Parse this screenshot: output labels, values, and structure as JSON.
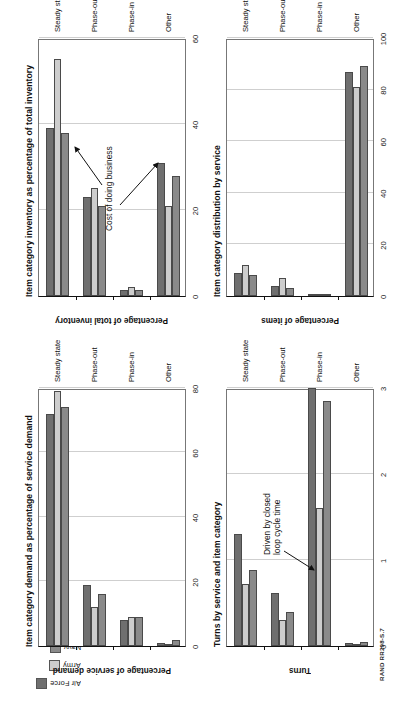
{
  "figure": {
    "source_note": "RAND RR298-S.7",
    "legend": {
      "title": "legend",
      "items": [
        {
          "label": "Air Force",
          "color": "#6f6f6f"
        },
        {
          "label": "Army",
          "color": "#cdcdcd"
        },
        {
          "label": "Navy",
          "color": "#8a8a8a"
        }
      ]
    }
  },
  "chart_data": [
    {
      "id": "turns",
      "type": "bar",
      "title": "Turns by service and item category",
      "xlabel": "",
      "ylabel": "Turns",
      "ylim": [
        0,
        3
      ],
      "yticks": [
        0,
        1,
        2,
        3
      ],
      "ytick_labels": [
        "0",
        "1",
        "2",
        "3"
      ],
      "grid": true,
      "orientation": "horizontal",
      "legend_position": "top-left",
      "categories": [
        "Steady state",
        "Phase-out",
        "Phase-in",
        "Other"
      ],
      "series": [
        {
          "name": "Air Force",
          "color": "#6f6f6f",
          "values": [
            1.3,
            0.62,
            3.0,
            0.03
          ]
        },
        {
          "name": "Army",
          "color": "#cdcdcd",
          "values": [
            0.72,
            0.3,
            1.6,
            0.02
          ]
        },
        {
          "name": "Navy",
          "color": "#8a8a8a",
          "values": [
            0.88,
            0.4,
            2.85,
            0.05
          ]
        }
      ],
      "annotations": [
        {
          "text": "Driven by closed\nloop cycle time",
          "target": "Phase-in"
        }
      ]
    },
    {
      "id": "demand",
      "type": "bar",
      "title": "Item category demand as percentage of service demand",
      "xlabel": "",
      "ylabel": "Percentage of service demand",
      "ylim": [
        0,
        80
      ],
      "yticks": [
        0,
        20,
        40,
        60,
        80
      ],
      "ytick_labels": [
        "0",
        "20",
        "40",
        "60",
        "80"
      ],
      "grid": true,
      "orientation": "horizontal",
      "legend_position": "top-left",
      "categories": [
        "Steady state",
        "Phase-out",
        "Phase-in",
        "Other"
      ],
      "series": [
        {
          "name": "Air Force",
          "color": "#6f6f6f",
          "values": [
            72,
            19,
            8,
            1
          ]
        },
        {
          "name": "Army",
          "color": "#cdcdcd",
          "values": [
            79,
            12,
            9,
            0.5
          ]
        },
        {
          "name": "Navy",
          "color": "#8a8a8a",
          "values": [
            74,
            16,
            9,
            2
          ]
        }
      ],
      "annotations": []
    },
    {
      "id": "inventory",
      "type": "bar",
      "title": "Item category inventory as percentage of total inventory",
      "xlabel": "",
      "ylabel": "Percentage of total inventory",
      "ylim": [
        0,
        60
      ],
      "yticks": [
        0,
        20,
        40,
        60
      ],
      "ytick_labels": [
        "0",
        "20",
        "40",
        "60"
      ],
      "grid": true,
      "orientation": "horizontal",
      "legend_position": "top-left",
      "categories": [
        "Steady state",
        "Phase-out",
        "Phase-in",
        "Other"
      ],
      "series": [
        {
          "name": "Air Force",
          "color": "#6f6f6f",
          "values": [
            39,
            23,
            1.5,
            31
          ]
        },
        {
          "name": "Army",
          "color": "#cdcdcd",
          "values": [
            55,
            25,
            2,
            21
          ]
        },
        {
          "name": "Navy",
          "color": "#8a8a8a",
          "values": [
            38,
            21,
            1.5,
            28
          ]
        }
      ],
      "annotations": [
        {
          "text": "Cost of doing business",
          "target": "Phase-out and Other"
        }
      ]
    },
    {
      "id": "distribution",
      "type": "bar",
      "title": "Item category distribution by service",
      "xlabel": "",
      "ylabel": "Percentage of items",
      "ylim": [
        0,
        100
      ],
      "yticks": [
        0,
        20,
        40,
        60,
        80,
        100
      ],
      "ytick_labels": [
        "0",
        "20",
        "40",
        "60",
        "80",
        "100"
      ],
      "grid": true,
      "orientation": "horizontal",
      "legend_position": "top-left",
      "categories": [
        "Steady state",
        "Phase-out",
        "Phase-in",
        "Other"
      ],
      "series": [
        {
          "name": "Air Force",
          "color": "#6f6f6f",
          "values": [
            9,
            4,
            0.4,
            87
          ]
        },
        {
          "name": "Army",
          "color": "#cdcdcd",
          "values": [
            12,
            7,
            0.4,
            81
          ]
        },
        {
          "name": "Navy",
          "color": "#8a8a8a",
          "values": [
            8,
            3,
            0.4,
            89
          ]
        }
      ],
      "annotations": []
    }
  ]
}
